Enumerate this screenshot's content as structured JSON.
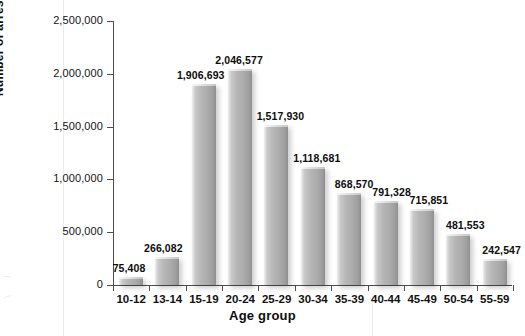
{
  "chart_data": {
    "type": "bar",
    "title": "",
    "subtitle": "",
    "xlabel": "Age group",
    "ylabel": "Number of arrests",
    "categories": [
      "10-12",
      "13-14",
      "15-19",
      "20-24",
      "25-29",
      "30-34",
      "35-39",
      "40-44",
      "45-49",
      "50-54",
      "55-59"
    ],
    "values": [
      75408,
      266082,
      1906693,
      2046577,
      1517930,
      1118681,
      868570,
      791328,
      715851,
      481553,
      242547
    ],
    "value_labels": [
      "75,408",
      "266,082",
      "1,906,693",
      "2,046,577",
      "1,517,930",
      "1,118,681",
      "868,570",
      "791,328",
      "715,851",
      "481,553",
      "242,547"
    ],
    "ylim": [
      0,
      2500000
    ],
    "ytick_values": [
      0,
      500000,
      1000000,
      1500000,
      2000000,
      2500000
    ],
    "ytick_labels": [
      "0",
      "500,000",
      "1,000,000",
      "1,500,000",
      "2,000,000",
      "2,500,000"
    ],
    "grid": false,
    "legend": null,
    "legend_position": "none",
    "colors": {
      "bar_light": "#e3e3e3",
      "bar_mid": "#b6b6b6",
      "bar_dark": "#8f8f8f",
      "axis": "#4d4d4d",
      "text": "#0d0d0d",
      "background": "#ffffff"
    }
  }
}
